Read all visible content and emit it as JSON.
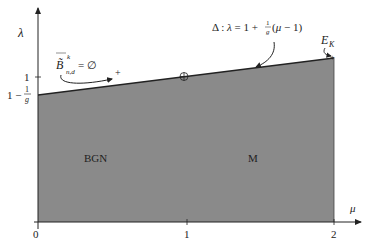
{
  "diagram": {
    "type": "phase-diagram",
    "axes": {
      "x": {
        "label": "μ",
        "ticks": [
          "0",
          "1",
          "2"
        ]
      },
      "y": {
        "label": "λ",
        "ticks": [
          "1",
          "1 − 1/g"
        ]
      }
    },
    "regions": [
      {
        "label": "BGN",
        "fill": "#8a8a8a"
      },
      {
        "label": "M",
        "fill": "#8a8a8a"
      }
    ],
    "boundary_line": {
      "label_prefix": "Δ : λ = 1 + ",
      "label_frac_num": "1",
      "label_frac_den": "g",
      "label_suffix": "(μ − 1)"
    },
    "annotations": {
      "set_label": "B̃",
      "set_sup": "k",
      "set_sub": "n,d",
      "set_eq": "= ∅",
      "endpoint_label": "E",
      "endpoint_sub": "K",
      "marker_plus": "+",
      "marker_circle_plus": "⊕"
    },
    "colors": {
      "shade": "#8a8a8a",
      "line": "#222222",
      "axis": "#222222"
    }
  }
}
